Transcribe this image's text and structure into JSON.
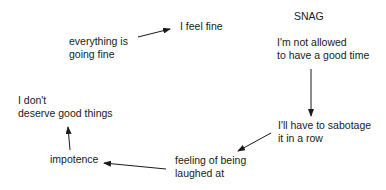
{
  "diagram": {
    "title": "SNAG",
    "nodes": [
      {
        "id": "everything-fine",
        "text": "everything is\ngoing fine"
      },
      {
        "id": "feel-fine",
        "text": "I feel fine"
      },
      {
        "id": "not-allowed",
        "text": "I'm not allowed\nto have a good time"
      },
      {
        "id": "sabotage",
        "text": "I'll have to sabotage\nit in a row"
      },
      {
        "id": "laughed-at",
        "text": "feeling of being\nlaughed at"
      },
      {
        "id": "impotence",
        "text": "impotence"
      },
      {
        "id": "dont-deserve",
        "text": "I don't\ndeserve good things"
      }
    ],
    "edges": [
      {
        "from": "everything-fine",
        "to": "feel-fine"
      },
      {
        "from": "not-allowed",
        "to": "sabotage"
      },
      {
        "from": "sabotage",
        "to": "laughed-at"
      },
      {
        "from": "laughed-at",
        "to": "impotence"
      },
      {
        "from": "impotence",
        "to": "dont-deserve"
      }
    ]
  }
}
